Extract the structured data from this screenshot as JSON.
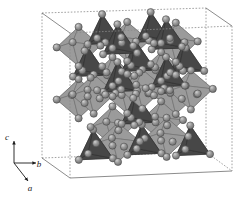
{
  "figure": {
    "background_color": "#ffffff"
  },
  "axes": {
    "name": "crystallographic-axis-triad",
    "origin": {
      "x": 14,
      "y": 163
    },
    "items": [
      {
        "label": "c",
        "direction": "up",
        "tip": {
          "x": 14,
          "y": 141
        },
        "label_pos": {
          "x": 7,
          "y": 140
        }
      },
      {
        "label": "b",
        "direction": "right",
        "tip": {
          "x": 36,
          "y": 163
        },
        "label_pos": {
          "x": 39,
          "y": 167
        }
      },
      {
        "label": "a",
        "direction": "down-left",
        "tip": {
          "x": 28,
          "y": 181
        },
        "label_pos": {
          "x": 30,
          "y": 191
        }
      }
    ]
  },
  "unit_cell": {
    "name": "unit-cell-box",
    "line_style": "dashed",
    "line_color": "#8a8a8a",
    "solid_edge_color": "#6e6e6e",
    "vertices": {
      "back_top_left": {
        "x": 42,
        "y": 13
      },
      "back_top_right": {
        "x": 206,
        "y": 8
      },
      "front_top_left": {
        "x": 70,
        "y": 33
      },
      "front_top_right": {
        "x": 232,
        "y": 26
      },
      "back_bottom_left": {
        "x": 42,
        "y": 158
      },
      "back_bottom_right": {
        "x": 206,
        "y": 152
      },
      "front_bottom_left": {
        "x": 70,
        "y": 178
      },
      "front_bottom_right": {
        "x": 232,
        "y": 171
      }
    }
  },
  "polyhedra": {
    "octahedra": {
      "name": "light-octahedra",
      "fill": "#c2c2c2",
      "fill_light": "#d8d8d8",
      "fill_dark": "#a2a2a2",
      "edge": "#6a6a6a",
      "count": 14
    },
    "tetrahedra": {
      "name": "dark-tetrahedra",
      "fill": "#585858",
      "fill_light": "#6e6e6e",
      "fill_dark": "#3e3e3e",
      "edge": "#2d2d2d",
      "count": 12
    }
  },
  "atoms": {
    "name": "vertex-spheres",
    "fill": "#8d8d8d",
    "highlight": "#c6c6c6",
    "outline": "#4a4a4a",
    "radius": 3.6,
    "count": 40
  }
}
